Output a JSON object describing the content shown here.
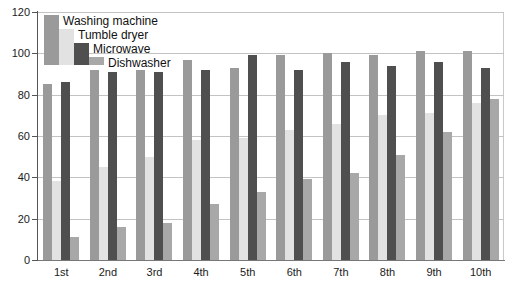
{
  "chart_data": {
    "type": "bar",
    "title": "",
    "subtitle": "",
    "xlabel": "",
    "ylabel": "",
    "ylim": [
      0,
      120
    ],
    "ytick_step": 20,
    "yticks": [
      0,
      20,
      40,
      60,
      80,
      100,
      120
    ],
    "ytick_labels": [
      "0",
      "20",
      "40",
      "60",
      "80",
      "100",
      "120"
    ],
    "grid": true,
    "grid_axis": "y",
    "legend_position": "top-left",
    "categories": [
      "1st",
      "2nd",
      "3rd",
      "4th",
      "5th",
      "6th",
      "7th",
      "8th",
      "9th",
      "10th"
    ],
    "series": [
      {
        "name": "Washing machine",
        "color": "#9a9a9a",
        "values": [
          85,
          92,
          92,
          97,
          93,
          99,
          100,
          99,
          101,
          101
        ]
      },
      {
        "name": "Tumble dryer",
        "color": "#e2e2e2",
        "values": [
          38,
          45,
          50,
          58,
          59,
          63,
          66,
          70,
          71,
          76
        ]
      },
      {
        "name": "Microwave",
        "color": "#4f4f4f",
        "values": [
          86,
          91,
          91,
          92,
          99,
          92,
          96,
          94,
          96,
          93
        ]
      },
      {
        "name": "Dishwasher",
        "color": "#a8a8a8",
        "values": [
          11,
          16,
          18,
          27,
          33,
          39,
          42,
          51,
          62,
          78
        ]
      }
    ]
  },
  "legend": {
    "items": [
      {
        "label": "Washing machine"
      },
      {
        "label": "Tumble dryer"
      },
      {
        "label": "Microwave"
      },
      {
        "label": "Dishwasher"
      }
    ]
  }
}
